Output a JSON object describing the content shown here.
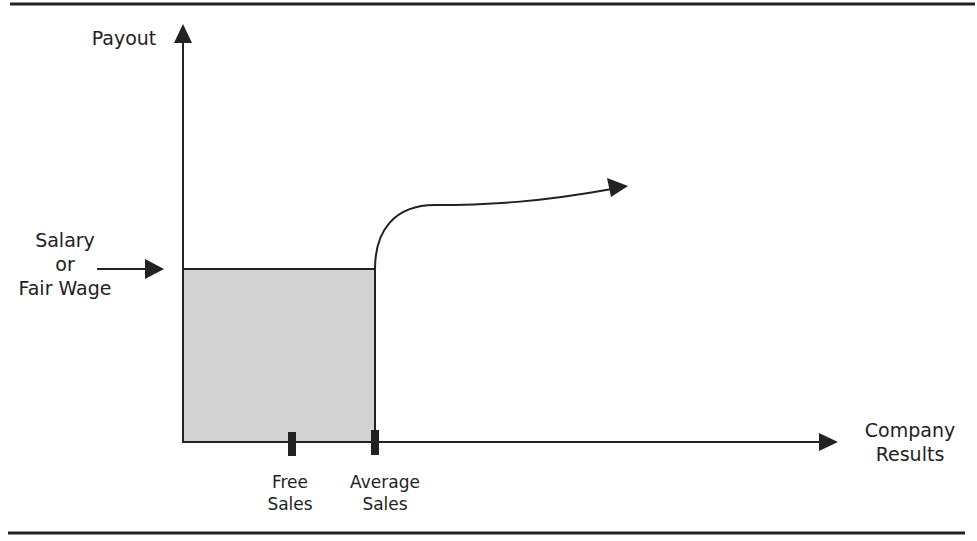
{
  "diagram": {
    "y_axis_label": "Payout",
    "x_axis_label_line1": "Company",
    "x_axis_label_line2": "Results",
    "salary_label_line1": "Salary",
    "salary_label_line2": "or",
    "salary_label_line3": "Fair Wage",
    "tick1_label_line1": "Free",
    "tick1_label_line2": "Sales",
    "tick2_label_line1": "Average",
    "tick2_label_line2": "Sales",
    "colors": {
      "line": "#222222",
      "fill": "#d2d2d2",
      "background": "#ffffff"
    }
  }
}
